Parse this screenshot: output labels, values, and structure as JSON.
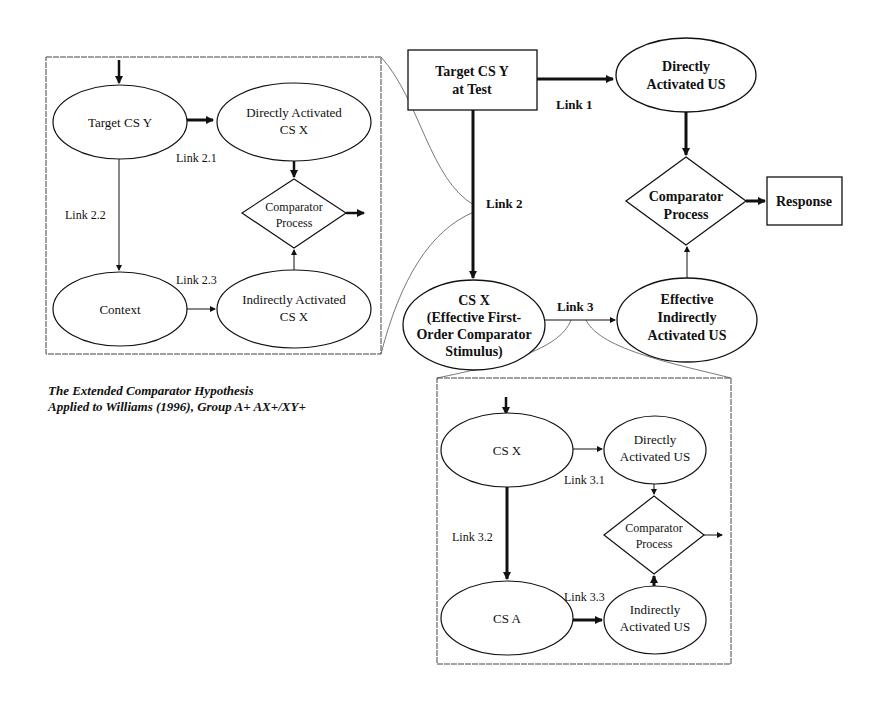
{
  "caption": {
    "line1": "The Extended Comparator Hypothesis",
    "line2": "Applied to Williams (1996), Group A+ AX+/XY+"
  },
  "main": {
    "target": {
      "line1": "Target CS Y",
      "line2": "at Test"
    },
    "direct_us": {
      "line1": "Directly",
      "line2": "Activated US"
    },
    "comparator": {
      "line1": "Comparator",
      "line2": "Process"
    },
    "response": "Response",
    "cs_x": {
      "line1": "CS X",
      "line2": "(Effective First-",
      "line3": "Order Comparator",
      "line4": "Stimulus)"
    },
    "eff_indirect": {
      "line1": "Effective",
      "line2": "Indirectly",
      "line3": "Activated US"
    },
    "link1": "Link 1",
    "link2": "Link 2",
    "link3": "Link 3"
  },
  "left_panel": {
    "target": "Target CS Y",
    "direct": {
      "line1": "Directly Activated",
      "line2": "CS X"
    },
    "comparator": {
      "line1": "Comparator",
      "line2": "Process"
    },
    "context": "Context",
    "indirect": {
      "line1": "Indirectly Activated",
      "line2": "CS X"
    },
    "link21": "Link 2.1",
    "link22": "Link 2.2",
    "link23": "Link 2.3"
  },
  "bottom_panel": {
    "csx": "CS X",
    "direct": {
      "line1": "Directly",
      "line2": "Activated US"
    },
    "comparator": {
      "line1": "Comparator",
      "line2": "Process"
    },
    "csa": "CS A",
    "indirect": {
      "line1": "Indirectly",
      "line2": "Activated US"
    },
    "link31": "Link 3.1",
    "link32": "Link 3.2",
    "link33": "Link 3.3"
  }
}
